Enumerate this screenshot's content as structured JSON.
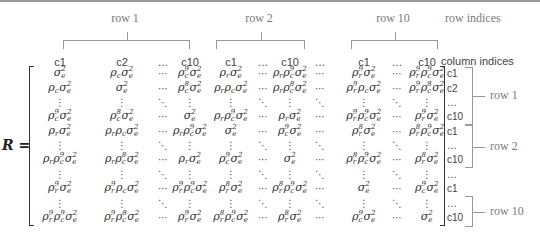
{
  "top_groups": [
    {
      "label": "row 1",
      "left": 63,
      "right": 188,
      "label_x": 125
    },
    {
      "label": "row 2",
      "left": 216,
      "right": 303,
      "label_x": 259
    },
    {
      "label": "row 10",
      "left": 351,
      "right": 436,
      "label_x": 393
    }
  ],
  "row_indices_label": "row indices",
  "column_indices_label": "column indices",
  "matrix_label": "R =",
  "column_headers": [
    {
      "x": 60,
      "text": "c1"
    },
    {
      "x": 122,
      "text": "c2"
    },
    {
      "x": 163,
      "text": "…"
    },
    {
      "x": 190,
      "text": "c10"
    },
    {
      "x": 231,
      "text": "c1"
    },
    {
      "x": 263,
      "text": "…"
    },
    {
      "x": 290,
      "text": "c10"
    },
    {
      "x": 320,
      "text": "…"
    },
    {
      "x": 364,
      "text": "c1"
    },
    {
      "x": 397,
      "text": "…"
    },
    {
      "x": 427,
      "text": "c10"
    }
  ],
  "column_x": [
    60,
    122,
    163,
    190,
    231,
    263,
    290,
    320,
    364,
    397,
    427
  ],
  "row_y": [
    73,
    88,
    102,
    116,
    131,
    145,
    159,
    174,
    188,
    203,
    217
  ],
  "matrix_rows": [
    [
      "σ_e^2",
      "ρ_cσ_e^2",
      "⋯",
      "ρ_c^9σ_e^2",
      "ρ_rσ_e^2",
      "⋯",
      "ρ_rρ_c^9σ_e^2",
      "⋯",
      "ρ_r^9σ_e^2",
      "⋯",
      "ρ_r^9ρ_c^9σ_e^2"
    ],
    [
      "ρ_cσ_e^2",
      "σ_e^2",
      "⋯",
      "ρ_c^8σ_e^2",
      "ρ_rρ_cσ_e^2",
      "⋯",
      "ρ_rρ_c^8σ_e^2",
      "⋯",
      "ρ_r^9ρ_cσ_e^2",
      "⋯",
      "ρ_r^9ρ_c^8σ_e^2"
    ],
    [
      "⋮",
      "⋮",
      "⋱",
      "⋮",
      "⋮",
      "⋱",
      "⋮",
      "⋱",
      "⋮",
      "⋱",
      "⋮"
    ],
    [
      "ρ_c^9σ_e^2",
      "ρ_c^8σ_e^2",
      "⋯",
      "σ_e^2",
      "ρ_rρ_c^9σ_e^2",
      "⋯",
      "ρ_rσ_e^2",
      "⋯",
      "ρ_r^9ρ_c^9σ_e^2",
      "⋯",
      "ρ_r^9σ_e^2"
    ],
    [
      "ρ_rσ_e^2",
      "ρ_rρ_cσ_e^2",
      "⋯",
      "ρ_rρ_c^9σ_e^2",
      "σ_e^2",
      "⋯",
      "ρ_c^9σ_e^2",
      "⋯",
      "ρ_r^8σ_e^2",
      "⋯",
      "ρ_r^8ρ_c^9σ_e^2"
    ],
    [
      "⋮",
      "⋮",
      "⋱",
      "⋮",
      "⋮",
      "⋱",
      "⋮",
      "⋱",
      "⋮",
      "⋱",
      "⋮"
    ],
    [
      "ρ_rρ_c^9σ_e^2",
      "ρ_rρ_c^8σ_e^2",
      "⋯",
      "ρ_rσ_e^2",
      "ρ_c^9σ_e^2",
      "⋯",
      "σ_e^2",
      "⋯",
      "ρ_r^8ρ_c^9σ_e^2",
      "⋯",
      "ρ_r^8σ_e^2"
    ],
    [
      "⋮",
      "⋮",
      "⋱",
      "⋮",
      "⋮",
      "⋱",
      "⋮",
      "⋱",
      "⋮",
      "⋱",
      "⋮"
    ],
    [
      "ρ_r^9σ_e^2",
      "ρ_r^9ρ_cσ_e^2",
      "⋯",
      "ρ_r^9ρ_c^9σ_e^2",
      "ρ_r^8σ_e^2",
      "⋯",
      "ρ_r^8ρ_c^9σ_e^2",
      "⋯",
      "σ_e^2",
      "⋯",
      "ρ_c^9σ_e^2"
    ],
    [
      "⋮",
      "⋮",
      "⋱",
      "⋮",
      "⋮",
      "⋱",
      "⋮",
      "⋱",
      "⋮",
      "⋱",
      "⋮"
    ],
    [
      "ρ_r^9ρ_c^9σ_e^2",
      "ρ_r^9ρ_c^8σ_e^2",
      "⋯",
      "ρ_r^9σ_e^2",
      "ρ_r^8ρ_c^9σ_e^2",
      "⋯",
      "ρ_r^8σ_e^2",
      "⋯",
      "ρ_c^9σ_e^2",
      "⋯",
      "σ_e^2"
    ]
  ],
  "right_index_labels": [
    "c1",
    "c2",
    "…",
    "c10",
    "c1",
    "…",
    "c10",
    "…",
    "c1",
    "…",
    "c10"
  ],
  "right_groups": [
    {
      "label": "row 1",
      "top": 67,
      "bottom": 123
    },
    {
      "label": "row 2",
      "top": 125,
      "bottom": 166
    },
    {
      "label": "row 10",
      "top": 196,
      "bottom": 225
    }
  ]
}
